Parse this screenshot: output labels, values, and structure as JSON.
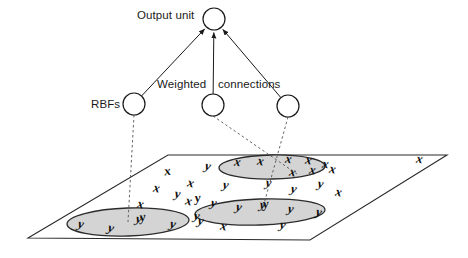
{
  "figure": {
    "title_labels": {
      "output_unit": "Output unit",
      "weighted": "Weighted",
      "connections": "connections",
      "rbfs": "RBFs"
    },
    "colors": {
      "stroke": "#1a1a1a",
      "ellipse_fill": "#d4d4d4",
      "ellipse_stroke": "#2b2b2b",
      "plane_stroke": "#2b2b2b",
      "dashed_stroke": "#555555",
      "glyph": "#0d0d0d",
      "background": "#ffffff"
    },
    "output_unit": {
      "cx": 214,
      "cy": 19,
      "r": 11
    },
    "rbf_units": [
      {
        "id": "rbf-unit-1",
        "cx": 134,
        "cy": 104,
        "r": 11
      },
      {
        "id": "rbf-unit-2",
        "cx": 213,
        "cy": 105,
        "r": 11
      },
      {
        "id": "rbf-unit-3",
        "cx": 288,
        "cy": 106,
        "r": 11
      }
    ],
    "connections": [
      {
        "id": "connection-1",
        "from": "rbf-unit-1",
        "to": "output-unit",
        "style": "solid-arrow"
      },
      {
        "id": "connection-2",
        "from": "rbf-unit-2",
        "to": "output-unit",
        "style": "solid-arrow"
      },
      {
        "id": "connection-3",
        "from": "rbf-unit-3",
        "to": "output-unit",
        "style": "solid-arrow"
      }
    ],
    "receptive_field_links": [
      {
        "id": "rbf-field-link-1",
        "from": "rbf-unit-1",
        "to": "field-left",
        "style": "dashed"
      },
      {
        "id": "rbf-field-link-2",
        "from": "rbf-unit-2",
        "to": "field-upper",
        "style": "dashed"
      },
      {
        "id": "rbf-field-link-3",
        "from": "rbf-unit-3",
        "to": "field-middle",
        "style": "dashed"
      }
    ],
    "plane": {
      "points": "168,155 447,155 310,240 28,238",
      "label": "input-space-plane"
    },
    "fields": [
      {
        "id": "field-left",
        "cx": 128,
        "cy": 222,
        "rx": 61,
        "ry": 14,
        "rot": -2
      },
      {
        "id": "field-upper",
        "cx": 272,
        "cy": 167,
        "rx": 53,
        "ry": 12,
        "rot": -1
      },
      {
        "id": "field-middle",
        "cx": 260,
        "cy": 212,
        "rx": 65,
        "ry": 13,
        "rot": -2
      }
    ],
    "data_points": [
      {
        "c": "y",
        "x": 80,
        "y": 228,
        "r": 12
      },
      {
        "c": "y",
        "x": 110,
        "y": 232,
        "r": 14
      },
      {
        "c": "y",
        "x": 138,
        "y": 223,
        "r": 10
      },
      {
        "c": "y",
        "x": 143,
        "y": 221,
        "r": -8
      },
      {
        "c": "y",
        "x": 172,
        "y": 228,
        "r": 12
      },
      {
        "c": "y",
        "x": 200,
        "y": 225,
        "r": 10
      },
      {
        "c": "x",
        "x": 168,
        "y": 175,
        "r": -8
      },
      {
        "c": "x",
        "x": 156,
        "y": 192,
        "r": 10
      },
      {
        "c": "x",
        "x": 190,
        "y": 187,
        "r": 12
      },
      {
        "c": "y",
        "x": 207,
        "y": 170,
        "r": 12
      },
      {
        "c": "y",
        "x": 177,
        "y": 198,
        "r": 8
      },
      {
        "c": "x",
        "x": 140,
        "y": 208,
        "r": 10
      },
      {
        "c": "x",
        "x": 188,
        "y": 205,
        "r": 12
      },
      {
        "c": "y",
        "x": 198,
        "y": 202,
        "r": -6
      },
      {
        "c": "x",
        "x": 237,
        "y": 166,
        "r": 8
      },
      {
        "c": "x",
        "x": 260,
        "y": 165,
        "r": 10
      },
      {
        "c": "x",
        "x": 288,
        "y": 163,
        "r": 8
      },
      {
        "c": "x",
        "x": 308,
        "y": 164,
        "r": 10
      },
      {
        "c": "x",
        "x": 325,
        "y": 168,
        "r": 8
      },
      {
        "c": "x",
        "x": 292,
        "y": 176,
        "r": 10
      },
      {
        "c": "x",
        "x": 312,
        "y": 174,
        "r": 8
      },
      {
        "c": "x",
        "x": 332,
        "y": 173,
        "r": 10
      },
      {
        "c": "y",
        "x": 225,
        "y": 189,
        "r": 10
      },
      {
        "c": "y",
        "x": 268,
        "y": 187,
        "r": 8
      },
      {
        "c": "y",
        "x": 293,
        "y": 193,
        "r": 10
      },
      {
        "c": "y",
        "x": 320,
        "y": 188,
        "r": 8
      },
      {
        "c": "x",
        "x": 338,
        "y": 196,
        "r": 10
      },
      {
        "c": "y",
        "x": 213,
        "y": 207,
        "r": 10
      },
      {
        "c": "y",
        "x": 238,
        "y": 211,
        "r": 12
      },
      {
        "c": "y",
        "x": 262,
        "y": 209,
        "r": 8
      },
      {
        "c": "y",
        "x": 266,
        "y": 208,
        "r": -6
      },
      {
        "c": "y",
        "x": 290,
        "y": 213,
        "r": 10
      },
      {
        "c": "y",
        "x": 318,
        "y": 216,
        "r": 12
      },
      {
        "c": "y",
        "x": 282,
        "y": 229,
        "r": 10
      },
      {
        "c": "x",
        "x": 223,
        "y": 230,
        "r": 10
      },
      {
        "c": "y",
        "x": 196,
        "y": 220,
        "r": 10
      },
      {
        "c": "x",
        "x": 419,
        "y": 163,
        "r": 8
      }
    ]
  }
}
